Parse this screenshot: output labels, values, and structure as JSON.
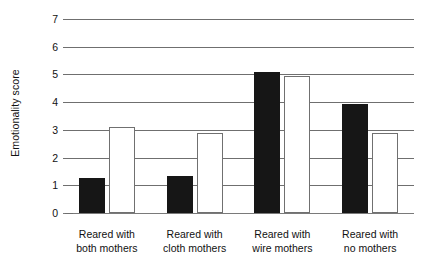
{
  "chart_data": {
    "type": "bar",
    "title": "",
    "xlabel": "",
    "ylabel": "Emotionality score",
    "ylim": [
      0,
      7
    ],
    "ytick_labels": [
      "0",
      "1",
      "2",
      "3",
      "4",
      "5",
      "6",
      "7"
    ],
    "yticks": [
      0,
      1,
      2,
      3,
      4,
      5,
      6,
      7
    ],
    "grid": true,
    "legend": "none",
    "categories": [
      "Reared with both mothers",
      "Reared with cloth mothers",
      "Reared with wire mothers",
      "Reared with no mothers"
    ],
    "category_lines": [
      [
        "Reared with",
        "both mothers"
      ],
      [
        "Reared with",
        "cloth mothers"
      ],
      [
        "Reared with",
        "wire mothers"
      ],
      [
        "Reared with",
        "no mothers"
      ]
    ],
    "series": [
      {
        "name": "black-bar",
        "fill": "#161616",
        "values": [
          1.25,
          1.35,
          5.1,
          3.95
        ]
      },
      {
        "name": "white-bar",
        "fill": "#ffffff",
        "values": [
          3.1,
          2.9,
          4.95,
          2.9
        ]
      }
    ]
  },
  "colors": {
    "filled_bar": "#161616",
    "hollow_bar_border": "#707070",
    "gridline": "#6f6f6f",
    "text": "#111111",
    "background": "#ffffff"
  }
}
